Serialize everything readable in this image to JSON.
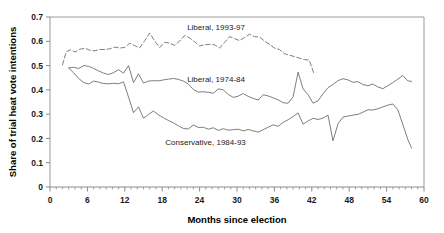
{
  "chart_data": {
    "type": "line",
    "title": "",
    "xlabel": "Months since election",
    "ylabel": "Share of trial heat vote intentions",
    "xlim": [
      0,
      60
    ],
    "ylim": [
      0,
      0.7
    ],
    "grid": false,
    "legend_position": "inline-annotations",
    "x_ticks": [
      "0",
      "6",
      "12",
      "18",
      "24",
      "30",
      "36",
      "42",
      "48",
      "54",
      "60"
    ],
    "x_tick_values": [
      0,
      6,
      12,
      18,
      24,
      30,
      36,
      42,
      48,
      54,
      60
    ],
    "x_minor_tick_step": 1,
    "y_ticks": [
      "0",
      "0.1",
      "0.2",
      "0.3",
      "0.4",
      "0.5",
      "0.6",
      "0.7"
    ],
    "y_tick_values": [
      0,
      0.1,
      0.2,
      0.3,
      0.4,
      0.5,
      0.6,
      0.7
    ],
    "series": [
      {
        "name": "Liberal, 1993-97",
        "style": "dashed",
        "color": "#6f6f6f",
        "label_x": 22.0,
        "label_y": 0.645,
        "x": [
          2.0,
          2.6,
          3.3,
          4.0,
          4.8,
          5.6,
          6.4,
          7.2,
          8.0,
          8.8,
          9.6,
          10.4,
          11.2,
          12.0,
          12.8,
          13.6,
          14.4,
          15.2,
          16.0,
          16.8,
          17.6,
          18.4,
          19.2,
          20.0,
          20.8,
          21.6,
          22.4,
          23.2,
          24.0,
          24.8,
          25.6,
          26.4,
          27.2,
          28.0,
          28.8,
          29.6,
          30.4,
          31.2,
          32.0,
          32.8,
          33.6,
          34.4,
          35.2,
          36.0,
          36.8,
          37.6,
          38.4,
          39.2,
          40.0,
          40.8,
          41.6,
          42.3
        ],
        "y": [
          0.503,
          0.557,
          0.565,
          0.556,
          0.567,
          0.572,
          0.563,
          0.561,
          0.566,
          0.566,
          0.569,
          0.576,
          0.572,
          0.575,
          0.592,
          0.582,
          0.573,
          0.603,
          0.634,
          0.601,
          0.574,
          0.596,
          0.592,
          0.583,
          0.601,
          0.624,
          0.614,
          0.598,
          0.581,
          0.586,
          0.587,
          0.586,
          0.572,
          0.595,
          0.619,
          0.611,
          0.603,
          0.615,
          0.629,
          0.619,
          0.618,
          0.601,
          0.588,
          0.572,
          0.566,
          0.549,
          0.543,
          0.537,
          0.531,
          0.525,
          0.522,
          0.47
        ]
      },
      {
        "name": "Liberal, 1974-84",
        "style": "solid",
        "color": "#6f6f6f",
        "label_x": 22.0,
        "label_y": 0.434,
        "x": [
          3.0,
          3.8,
          4.6,
          5.4,
          6.2,
          7.0,
          7.8,
          8.6,
          9.4,
          10.2,
          11.0,
          11.8,
          12.6,
          13.4,
          14.2,
          15.0,
          15.8,
          16.6,
          17.4,
          18.2,
          19.0,
          19.8,
          20.6,
          21.4,
          22.2,
          23.0,
          23.8,
          24.6,
          25.4,
          26.2,
          27.0,
          27.8,
          28.6,
          29.4,
          30.2,
          31.0,
          31.8,
          32.6,
          33.4,
          34.2,
          35.0,
          35.8,
          36.6,
          37.4,
          38.2,
          39.0,
          39.8,
          40.6,
          41.4,
          42.2,
          43.0,
          43.8,
          44.6,
          45.4,
          46.2,
          47.0,
          47.8,
          48.6,
          49.4,
          50.2,
          51.0,
          51.8,
          52.6,
          53.4,
          54.2,
          55.0,
          55.8,
          56.6,
          57.4,
          58.0
        ],
        "y": [
          0.49,
          0.493,
          0.488,
          0.5,
          0.497,
          0.488,
          0.478,
          0.469,
          0.463,
          0.471,
          0.483,
          0.469,
          0.5,
          0.43,
          0.466,
          0.428,
          0.436,
          0.438,
          0.437,
          0.441,
          0.444,
          0.447,
          0.443,
          0.436,
          0.424,
          0.401,
          0.391,
          0.392,
          0.39,
          0.386,
          0.404,
          0.4,
          0.381,
          0.369,
          0.374,
          0.385,
          0.373,
          0.365,
          0.358,
          0.38,
          0.375,
          0.367,
          0.359,
          0.347,
          0.345,
          0.371,
          0.473,
          0.404,
          0.38,
          0.345,
          0.355,
          0.384,
          0.409,
          0.422,
          0.438,
          0.446,
          0.441,
          0.431,
          0.434,
          0.422,
          0.417,
          0.424,
          0.412,
          0.405,
          0.417,
          0.43,
          0.444,
          0.459,
          0.437,
          0.435
        ]
      },
      {
        "name": "Conservative, 1984-93",
        "style": "solid",
        "color": "#6f6f6f",
        "label_x": 18.5,
        "label_y": 0.173,
        "x": [
          3.0,
          3.8,
          4.6,
          5.4,
          6.2,
          7.0,
          7.8,
          8.6,
          9.4,
          10.2,
          11.0,
          11.8,
          12.6,
          13.4,
          14.2,
          15.0,
          15.8,
          16.6,
          17.4,
          18.2,
          19.0,
          19.8,
          20.6,
          21.4,
          22.2,
          23.0,
          23.8,
          24.6,
          25.4,
          26.2,
          27.0,
          27.8,
          28.6,
          29.4,
          30.2,
          31.0,
          31.8,
          32.6,
          33.4,
          34.2,
          35.0,
          35.8,
          36.6,
          37.4,
          38.2,
          39.0,
          39.8,
          40.6,
          41.4,
          42.2,
          43.0,
          43.8,
          44.6,
          45.4,
          46.2,
          47.0,
          47.8,
          48.6,
          49.4,
          50.2,
          51.0,
          51.8,
          52.6,
          53.4,
          54.2,
          55.0,
          55.8,
          56.6,
          57.4,
          58.0
        ],
        "y": [
          0.49,
          0.47,
          0.447,
          0.43,
          0.424,
          0.436,
          0.432,
          0.426,
          0.425,
          0.427,
          0.425,
          0.433,
          0.37,
          0.306,
          0.33,
          0.283,
          0.299,
          0.313,
          0.297,
          0.285,
          0.274,
          0.264,
          0.252,
          0.241,
          0.239,
          0.255,
          0.245,
          0.246,
          0.238,
          0.244,
          0.233,
          0.24,
          0.234,
          0.236,
          0.238,
          0.231,
          0.237,
          0.231,
          0.226,
          0.236,
          0.246,
          0.256,
          0.25,
          0.266,
          0.277,
          0.29,
          0.305,
          0.259,
          0.272,
          0.283,
          0.278,
          0.284,
          0.296,
          0.19,
          0.26,
          0.288,
          0.292,
          0.296,
          0.299,
          0.308,
          0.318,
          0.317,
          0.322,
          0.33,
          0.337,
          0.342,
          0.318,
          0.258,
          0.196,
          0.16
        ]
      }
    ]
  }
}
